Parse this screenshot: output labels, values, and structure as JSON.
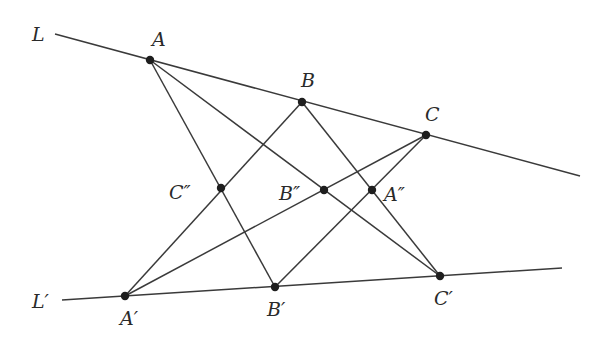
{
  "figure": {
    "colors": {
      "line": "#3a3a3a",
      "point": "#1e1e1e",
      "label": "#2a2a2a",
      "background": "#ffffff"
    },
    "lines": [
      {
        "id": "L",
        "label": "L",
        "x1": 55,
        "y1": 34,
        "x2": 580,
        "y2": 176,
        "label_x": 32,
        "label_y": 41
      },
      {
        "id": "Lp",
        "label": "L′",
        "x1": 62,
        "y1": 300,
        "x2": 562,
        "y2": 268,
        "label_x": 32,
        "label_y": 308
      }
    ],
    "points": [
      {
        "id": "A",
        "label": "A",
        "x": 150,
        "y": 60,
        "label_x": 152,
        "label_y": 46
      },
      {
        "id": "B",
        "label": "B",
        "x": 302,
        "y": 102,
        "label_x": 301,
        "label_y": 87
      },
      {
        "id": "C",
        "label": "C",
        "x": 426,
        "y": 135,
        "label_x": 425,
        "label_y": 121
      },
      {
        "id": "A2",
        "label": "A″",
        "x": 372,
        "y": 190,
        "label_x": 384,
        "label_y": 201
      },
      {
        "id": "B2",
        "label": "B″",
        "x": 324,
        "y": 190,
        "label_x": 279,
        "label_y": 200
      },
      {
        "id": "C2",
        "label": "C″",
        "x": 221,
        "y": 188,
        "label_x": 169,
        "label_y": 199
      },
      {
        "id": "Ap",
        "label": "A′",
        "x": 125,
        "y": 296,
        "label_x": 120,
        "label_y": 325
      },
      {
        "id": "Bp",
        "label": "B′",
        "x": 275,
        "y": 287,
        "label_x": 267,
        "label_y": 316
      },
      {
        "id": "Cp",
        "label": "C′",
        "x": 440,
        "y": 276,
        "label_x": 434,
        "label_y": 305
      }
    ],
    "segments": [
      {
        "from": "A",
        "to": "Bp"
      },
      {
        "from": "A",
        "to": "Cp"
      },
      {
        "from": "B",
        "to": "Ap"
      },
      {
        "from": "B",
        "to": "Cp"
      },
      {
        "from": "C",
        "to": "Ap"
      },
      {
        "from": "C",
        "to": "Bp"
      }
    ]
  }
}
